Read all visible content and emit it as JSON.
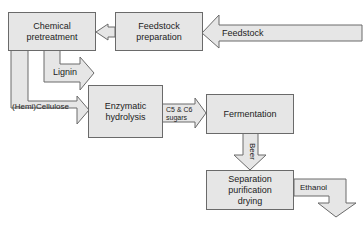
{
  "diagram": {
    "nodes": [
      {
        "id": "chemical",
        "label": "Chemical\npretreatment"
      },
      {
        "id": "feedstock_prep",
        "label": "Feedstock\npreparation"
      },
      {
        "id": "enzymatic",
        "label": "Enzymatic\nhydrolysis"
      },
      {
        "id": "fermentation",
        "label": "Fermentation"
      },
      {
        "id": "separation",
        "label": "Separation\npurification\ndrying"
      }
    ],
    "edges": [
      {
        "from": "input",
        "to": "feedstock_prep",
        "label": "Feedstock"
      },
      {
        "from": "feedstock_prep",
        "to": "chemical",
        "label": ""
      },
      {
        "from": "chemical",
        "to": "output",
        "label": "Lignin"
      },
      {
        "from": "chemical",
        "to": "enzymatic",
        "label": "(Hemi)Cellulose"
      },
      {
        "from": "enzymatic",
        "to": "fermentation",
        "label": "C5 & C6 sugars"
      },
      {
        "from": "fermentation",
        "to": "separation",
        "label": "Beer"
      },
      {
        "from": "separation",
        "to": "output",
        "label": "Ethanol"
      }
    ],
    "colors": {
      "fill": "#e6e6e6",
      "stroke": "#6a6a6a"
    }
  },
  "labels": {
    "chemical_1": "Chemical",
    "chemical_2": "pretreatment",
    "feedprep_1": "Feedstock",
    "feedprep_2": "preparation",
    "enzymatic_1": "Enzymatic",
    "enzymatic_2": "hydrolysis",
    "fermentation": "Fermentation",
    "separation_1": "Separation",
    "separation_2": "purification",
    "separation_3": "drying",
    "feedstock": "Feedstock",
    "lignin": "Lignin",
    "cellulose": "(Hemi)Cellulose",
    "sugars_1": "C5 & C6",
    "sugars_2": "sugars",
    "beer": "Beer",
    "ethanol": "Ethanol"
  }
}
